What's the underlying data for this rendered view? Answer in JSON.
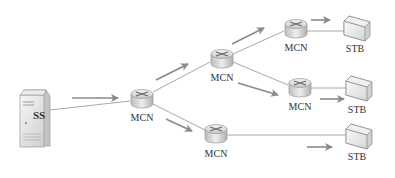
{
  "diagram": {
    "type": "network-topology",
    "colors": {
      "line": "#a8a8a8",
      "arrow": "#8a8a8a",
      "text": "#333333"
    },
    "nodes": [
      {
        "id": "ss",
        "type": "server",
        "label": "SS",
        "x": 30,
        "y": 118
      },
      {
        "id": "mcn1",
        "type": "router",
        "label": "MCN",
        "x": 142,
        "y": 98
      },
      {
        "id": "mcn2",
        "type": "router",
        "label": "MCN",
        "x": 222,
        "y": 58
      },
      {
        "id": "mcn3",
        "type": "router",
        "label": "MCN",
        "x": 296,
        "y": 28
      },
      {
        "id": "mcn4",
        "type": "router",
        "label": "MCN",
        "x": 300,
        "y": 87
      },
      {
        "id": "mcn5",
        "type": "router",
        "label": "MCN",
        "x": 216,
        "y": 133
      },
      {
        "id": "stb1",
        "type": "stb",
        "label": "STB",
        "x": 354,
        "y": 24
      },
      {
        "id": "stb2",
        "type": "stb",
        "label": "STB",
        "x": 356,
        "y": 90
      },
      {
        "id": "stb3",
        "type": "stb",
        "label": "STB",
        "x": 356,
        "y": 137
      }
    ],
    "edges": [
      {
        "from": "ss",
        "to": "mcn1"
      },
      {
        "from": "mcn1",
        "to": "mcn2"
      },
      {
        "from": "mcn1",
        "to": "mcn5"
      },
      {
        "from": "mcn2",
        "to": "mcn3"
      },
      {
        "from": "mcn2",
        "to": "mcn4"
      },
      {
        "from": "mcn3",
        "to": "stb1"
      },
      {
        "from": "mcn4",
        "to": "stb2"
      },
      {
        "from": "mcn5",
        "to": "stb3"
      }
    ],
    "labels": {
      "ss": "SS",
      "mcn1": "MCN",
      "mcn2": "MCN",
      "mcn3": "MCN",
      "mcn4": "MCN",
      "mcn5": "MCN",
      "stb1": "STB",
      "stb2": "STB",
      "stb3": "STB"
    }
  }
}
